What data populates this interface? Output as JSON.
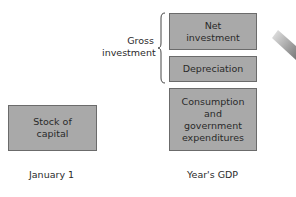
{
  "diagram": {
    "boxes": {
      "net_investment": "Net\ninvestment",
      "depreciation": "Depreciation",
      "consumption": "Consumption\nand\ngovernment\nexpenditures",
      "stock_of_capital": "Stock of\ncapital"
    },
    "brace_label": "Gross\ninvestment",
    "axis_labels": {
      "left": "January 1",
      "right": "Year's GDP"
    },
    "colors": {
      "box_fill": "#a9a9a9",
      "box_border": "#6b6b6b",
      "text": "#2a2a2a"
    }
  }
}
